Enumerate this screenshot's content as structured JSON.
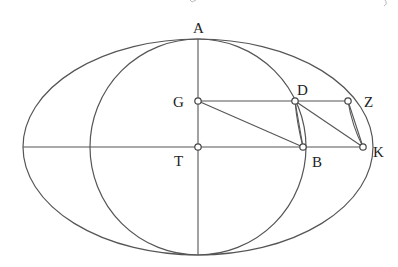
{
  "figure": {
    "type": "geometric-diagram",
    "stroke_color": "#555555",
    "background": "#ffffff"
  },
  "shapes": {
    "ellipse": {
      "cx": 198,
      "cy": 147,
      "rx": 175,
      "ry": 108
    },
    "circle": {
      "cx": 198,
      "cy": 147,
      "r": 108
    }
  },
  "points": {
    "A": {
      "label": "A",
      "x": 198,
      "y": 39
    },
    "G": {
      "label": "G",
      "x": 198,
      "y": 101
    },
    "T": {
      "label": "T",
      "x": 198,
      "y": 147
    },
    "D": {
      "label": "D",
      "x": 295,
      "y": 101
    },
    "Z": {
      "label": "Z",
      "x": 348,
      "y": 101
    },
    "B": {
      "label": "B",
      "x": 303,
      "y": 147
    },
    "K": {
      "label": "K",
      "x": 363,
      "y": 147
    }
  },
  "labels": {
    "A": "A",
    "G": "G",
    "T": "T",
    "D": "D",
    "Z": "Z",
    "B": "B",
    "K": "K"
  },
  "segments": [
    {
      "from": "A",
      "to": "bottom",
      "name": "vertical-axis"
    },
    {
      "from": "ellipse-left",
      "to": "K",
      "name": "horizontal-axis"
    },
    {
      "from": "G",
      "to": "Z",
      "name": "segment-GZ"
    },
    {
      "from": "G",
      "to": "B",
      "name": "segment-GB"
    },
    {
      "from": "D",
      "to": "B",
      "name": "segment-DB"
    },
    {
      "from": "D",
      "to": "K",
      "name": "segment-DK"
    },
    {
      "from": "Z",
      "to": "K",
      "name": "segment-ZK"
    }
  ]
}
